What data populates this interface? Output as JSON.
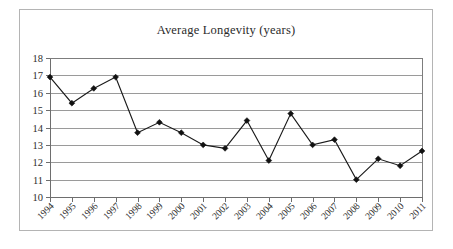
{
  "chart_data": {
    "type": "line",
    "title": "Average Longevity (years)",
    "xlabel": "",
    "ylabel": "",
    "categories": [
      "1994",
      "1995",
      "1996",
      "1997",
      "1998",
      "1999",
      "2000",
      "2001",
      "2002",
      "2003",
      "2004",
      "2005",
      "2006",
      "2007",
      "2008",
      "2009",
      "2010",
      "2011"
    ],
    "values": [
      16.9,
      15.4,
      16.25,
      16.9,
      13.7,
      14.3,
      13.7,
      13.0,
      12.8,
      14.4,
      12.1,
      14.8,
      13.0,
      13.3,
      11.0,
      12.2,
      11.8,
      12.65
    ],
    "series": [
      {
        "name": "Average Longevity",
        "values": [
          16.9,
          15.4,
          16.25,
          16.9,
          13.7,
          14.3,
          13.7,
          13.0,
          12.8,
          14.4,
          12.1,
          14.8,
          13.0,
          13.3,
          11.0,
          12.2,
          11.8,
          12.65
        ]
      }
    ],
    "ylim": [
      10,
      18
    ],
    "yticks": [
      10,
      11,
      12,
      13,
      14,
      15,
      16,
      17,
      18
    ],
    "ytick_labels": [
      "10",
      "11",
      "12",
      "13",
      "14",
      "15",
      "16",
      "17",
      "18"
    ],
    "grid": true,
    "grid_axis": "y",
    "legend": false,
    "legend_position": "none",
    "marker": "diamond",
    "xtick_label_rotation": 45,
    "colors": {
      "line": "#1a1a1a",
      "marker": "#111111",
      "gridline": "#9a9a9a",
      "axis": "#6e6e6e",
      "plot_border": "#7d7d7d",
      "frame_border": "#b4b4b4",
      "background": "#ffffff",
      "text": "#2e2e2e"
    }
  }
}
